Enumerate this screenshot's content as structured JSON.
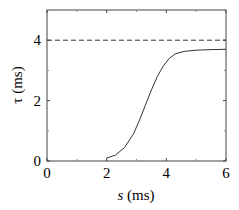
{
  "chart_data": {
    "type": "line",
    "title": "",
    "xlabel": "s (ms)",
    "ylabel": "τ (ms)",
    "xlim": [
      0,
      6
    ],
    "ylim": [
      0,
      5
    ],
    "xticks": [
      "0",
      "2",
      "4",
      "6"
    ],
    "yticks": [
      "0",
      "2",
      "4"
    ],
    "grid": false,
    "series": [
      {
        "name": "τ(s)",
        "style": "solid",
        "x": [
          2.0,
          2.3,
          2.6,
          2.9,
          3.1,
          3.3,
          3.5,
          3.7,
          3.9,
          4.1,
          4.3,
          4.6,
          5.0,
          5.5,
          6.0
        ],
        "y": [
          0.1,
          0.2,
          0.45,
          0.9,
          1.35,
          1.85,
          2.35,
          2.8,
          3.15,
          3.4,
          3.55,
          3.63,
          3.67,
          3.69,
          3.7
        ]
      },
      {
        "name": "asymptote",
        "style": "dashed",
        "x": [
          0,
          6
        ],
        "y": [
          4,
          4
        ]
      }
    ]
  },
  "labels": {
    "x": "s",
    "x_unit": " (ms)",
    "y": "τ (ms)"
  }
}
